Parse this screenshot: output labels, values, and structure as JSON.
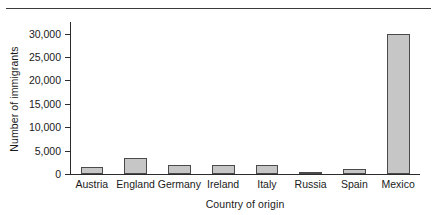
{
  "chart_data": {
    "type": "bar",
    "title": "",
    "subtitle": "",
    "xlabel": "Country of origin",
    "ylabel": "Number of immigrants",
    "categories": [
      "Austria",
      "England",
      "Germany",
      "Ireland",
      "Italy",
      "Russia",
      "Spain",
      "Mexico"
    ],
    "values": [
      1500,
      3400,
      2000,
      1900,
      2000,
      300,
      1000,
      30000
    ],
    "ylim": [
      0,
      32500
    ],
    "yticks": [
      0,
      5000,
      10000,
      15000,
      20000,
      25000,
      30000
    ],
    "ytick_labels": [
      "0",
      "5,000",
      "10,000",
      "15,000",
      "20,000",
      "25,000",
      "30,000"
    ],
    "grid": false,
    "legend": "none",
    "bar_fill_color": "#c6c6c6",
    "bar_edge_color": "#4a4a4a",
    "axis_color": "#2b2b2b"
  }
}
